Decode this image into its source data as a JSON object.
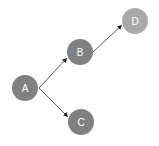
{
  "diagram": {
    "type": "directed-graph",
    "nodes": [
      {
        "id": "A",
        "label": "A",
        "cx": 25,
        "cy": 88,
        "r": 13,
        "color": "#808080"
      },
      {
        "id": "B",
        "label": "B",
        "cx": 80,
        "cy": 52,
        "r": 13,
        "color": "#808080"
      },
      {
        "id": "C",
        "label": "C",
        "cx": 81,
        "cy": 122,
        "r": 13,
        "color": "#808080"
      },
      {
        "id": "D",
        "label": "D",
        "cx": 135,
        "cy": 21,
        "r": 13,
        "color": "#a9a9a9"
      }
    ],
    "edges": [
      {
        "from": "A",
        "to": "B"
      },
      {
        "from": "A",
        "to": "C"
      },
      {
        "from": "B",
        "to": "D"
      }
    ],
    "edge_color": "#333333",
    "label_color": "#ffffff"
  }
}
